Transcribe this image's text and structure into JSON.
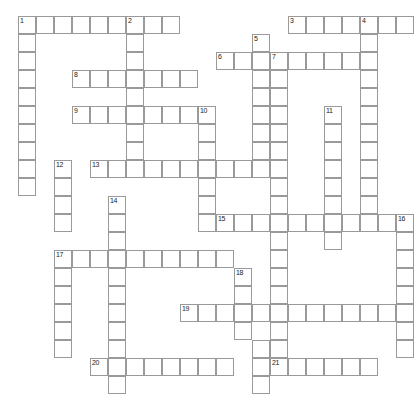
{
  "puzzle": {
    "title": "Crossword Grid",
    "type": "crossword",
    "cell_size": 18,
    "origin": {
      "x": 18,
      "y": 16
    },
    "grid_colors": {
      "cell_border": "#9a9a9a",
      "cell_fill": "#ffffff",
      "number": "#1a1a1a",
      "background": "#ffffff"
    },
    "entries": [
      {
        "number": 1,
        "direction": "across",
        "row": 0,
        "col": 0,
        "length": 9
      },
      {
        "number": 1,
        "direction": "down",
        "row": 0,
        "col": 0,
        "length": 10
      },
      {
        "number": 2,
        "direction": "down",
        "row": 0,
        "col": 6,
        "length": 9
      },
      {
        "number": 3,
        "direction": "across",
        "row": 0,
        "col": 15,
        "length": 7
      },
      {
        "number": 4,
        "direction": "down",
        "row": 0,
        "col": 19,
        "length": 12
      },
      {
        "number": 5,
        "direction": "down",
        "row": 1,
        "col": 13,
        "length": 6
      },
      {
        "number": 6,
        "direction": "across",
        "row": 2,
        "col": 11,
        "length": 9
      },
      {
        "number": 7,
        "direction": "down",
        "row": 2,
        "col": 14,
        "length": 17
      },
      {
        "number": 8,
        "direction": "across",
        "row": 3,
        "col": 3,
        "length": 7
      },
      {
        "number": 9,
        "direction": "across",
        "row": 5,
        "col": 3,
        "length": 8
      },
      {
        "number": 10,
        "direction": "down",
        "row": 5,
        "col": 10,
        "length": 7
      },
      {
        "number": 11,
        "direction": "down",
        "row": 5,
        "col": 17,
        "length": 8
      },
      {
        "number": 12,
        "direction": "down",
        "row": 8,
        "col": 2,
        "length": 4
      },
      {
        "number": 13,
        "direction": "across",
        "row": 8,
        "col": 4,
        "length": 11
      },
      {
        "number": 14,
        "direction": "down",
        "row": 10,
        "col": 5,
        "length": 10
      },
      {
        "number": 15,
        "direction": "across",
        "row": 11,
        "col": 11,
        "length": 10
      },
      {
        "number": 16,
        "direction": "down",
        "row": 11,
        "col": 21,
        "length": 7
      },
      {
        "number": 17,
        "direction": "across",
        "row": 13,
        "col": 2,
        "length": 10
      },
      {
        "number": 18,
        "direction": "down",
        "row": 14,
        "col": 12,
        "length": 5
      },
      {
        "number": 19,
        "direction": "across",
        "row": 16,
        "col": 9,
        "length": 13
      },
      {
        "number": 20,
        "direction": "across",
        "row": 19,
        "col": 4,
        "length": 8
      },
      {
        "number": 21,
        "direction": "across",
        "row": 19,
        "col": 14,
        "length": 6
      }
    ],
    "cells": [
      {
        "row": 0,
        "col": 0,
        "number": 1
      },
      {
        "row": 0,
        "col": 1
      },
      {
        "row": 0,
        "col": 2
      },
      {
        "row": 0,
        "col": 3
      },
      {
        "row": 0,
        "col": 4
      },
      {
        "row": 0,
        "col": 5
      },
      {
        "row": 0,
        "col": 6,
        "number": 2
      },
      {
        "row": 0,
        "col": 7
      },
      {
        "row": 0,
        "col": 8
      },
      {
        "row": 0,
        "col": 15,
        "number": 3
      },
      {
        "row": 0,
        "col": 16
      },
      {
        "row": 0,
        "col": 17
      },
      {
        "row": 0,
        "col": 18
      },
      {
        "row": 0,
        "col": 19,
        "number": 4
      },
      {
        "row": 0,
        "col": 20
      },
      {
        "row": 0,
        "col": 21
      },
      {
        "row": 1,
        "col": 0
      },
      {
        "row": 1,
        "col": 6
      },
      {
        "row": 1,
        "col": 13,
        "number": 5
      },
      {
        "row": 1,
        "col": 19
      },
      {
        "row": 2,
        "col": 0
      },
      {
        "row": 2,
        "col": 6
      },
      {
        "row": 2,
        "col": 11,
        "number": 6
      },
      {
        "row": 2,
        "col": 12
      },
      {
        "row": 2,
        "col": 13
      },
      {
        "row": 2,
        "col": 14,
        "number": 7
      },
      {
        "row": 2,
        "col": 15
      },
      {
        "row": 2,
        "col": 16
      },
      {
        "row": 2,
        "col": 17
      },
      {
        "row": 2,
        "col": 18
      },
      {
        "row": 2,
        "col": 19
      },
      {
        "row": 3,
        "col": 0
      },
      {
        "row": 3,
        "col": 3,
        "number": 8
      },
      {
        "row": 3,
        "col": 4
      },
      {
        "row": 3,
        "col": 5
      },
      {
        "row": 3,
        "col": 6
      },
      {
        "row": 3,
        "col": 7
      },
      {
        "row": 3,
        "col": 8
      },
      {
        "row": 3,
        "col": 9
      },
      {
        "row": 3,
        "col": 13
      },
      {
        "row": 3,
        "col": 14
      },
      {
        "row": 3,
        "col": 19
      },
      {
        "row": 4,
        "col": 0
      },
      {
        "row": 4,
        "col": 6
      },
      {
        "row": 4,
        "col": 13
      },
      {
        "row": 4,
        "col": 14
      },
      {
        "row": 4,
        "col": 19
      },
      {
        "row": 5,
        "col": 0
      },
      {
        "row": 5,
        "col": 3,
        "number": 9
      },
      {
        "row": 5,
        "col": 4
      },
      {
        "row": 5,
        "col": 5
      },
      {
        "row": 5,
        "col": 6
      },
      {
        "row": 5,
        "col": 7
      },
      {
        "row": 5,
        "col": 8
      },
      {
        "row": 5,
        "col": 9
      },
      {
        "row": 5,
        "col": 10,
        "number": 10
      },
      {
        "row": 5,
        "col": 13
      },
      {
        "row": 5,
        "col": 14
      },
      {
        "row": 5,
        "col": 17,
        "number": 11
      },
      {
        "row": 5,
        "col": 19
      },
      {
        "row": 6,
        "col": 0
      },
      {
        "row": 6,
        "col": 6
      },
      {
        "row": 6,
        "col": 10
      },
      {
        "row": 6,
        "col": 13
      },
      {
        "row": 6,
        "col": 14
      },
      {
        "row": 6,
        "col": 17
      },
      {
        "row": 6,
        "col": 19
      },
      {
        "row": 7,
        "col": 0
      },
      {
        "row": 7,
        "col": 6
      },
      {
        "row": 7,
        "col": 10
      },
      {
        "row": 7,
        "col": 13
      },
      {
        "row": 7,
        "col": 14
      },
      {
        "row": 7,
        "col": 17
      },
      {
        "row": 7,
        "col": 19
      },
      {
        "row": 8,
        "col": 0
      },
      {
        "row": 8,
        "col": 2,
        "number": 12
      },
      {
        "row": 8,
        "col": 4,
        "number": 13
      },
      {
        "row": 8,
        "col": 5
      },
      {
        "row": 8,
        "col": 6
      },
      {
        "row": 8,
        "col": 7
      },
      {
        "row": 8,
        "col": 8
      },
      {
        "row": 8,
        "col": 9
      },
      {
        "row": 8,
        "col": 10
      },
      {
        "row": 8,
        "col": 11
      },
      {
        "row": 8,
        "col": 12
      },
      {
        "row": 8,
        "col": 13
      },
      {
        "row": 8,
        "col": 14
      },
      {
        "row": 8,
        "col": 17
      },
      {
        "row": 8,
        "col": 19
      },
      {
        "row": 9,
        "col": 0
      },
      {
        "row": 9,
        "col": 2
      },
      {
        "row": 9,
        "col": 10
      },
      {
        "row": 9,
        "col": 14
      },
      {
        "row": 9,
        "col": 17
      },
      {
        "row": 9,
        "col": 19
      },
      {
        "row": 10,
        "col": 2
      },
      {
        "row": 10,
        "col": 5,
        "number": 14
      },
      {
        "row": 10,
        "col": 10
      },
      {
        "row": 10,
        "col": 14
      },
      {
        "row": 10,
        "col": 17
      },
      {
        "row": 10,
        "col": 19
      },
      {
        "row": 11,
        "col": 2
      },
      {
        "row": 11,
        "col": 5
      },
      {
        "row": 11,
        "col": 10
      },
      {
        "row": 11,
        "col": 11,
        "number": 15
      },
      {
        "row": 11,
        "col": 12
      },
      {
        "row": 11,
        "col": 13
      },
      {
        "row": 11,
        "col": 14
      },
      {
        "row": 11,
        "col": 15
      },
      {
        "row": 11,
        "col": 16
      },
      {
        "row": 11,
        "col": 17
      },
      {
        "row": 11,
        "col": 18
      },
      {
        "row": 11,
        "col": 19
      },
      {
        "row": 11,
        "col": 20
      },
      {
        "row": 11,
        "col": 21,
        "number": 16
      },
      {
        "row": 12,
        "col": 5
      },
      {
        "row": 12,
        "col": 14
      },
      {
        "row": 12,
        "col": 17
      },
      {
        "row": 12,
        "col": 21
      },
      {
        "row": 13,
        "col": 2,
        "number": 17
      },
      {
        "row": 13,
        "col": 3
      },
      {
        "row": 13,
        "col": 4
      },
      {
        "row": 13,
        "col": 5
      },
      {
        "row": 13,
        "col": 6
      },
      {
        "row": 13,
        "col": 7
      },
      {
        "row": 13,
        "col": 8
      },
      {
        "row": 13,
        "col": 9
      },
      {
        "row": 13,
        "col": 10
      },
      {
        "row": 13,
        "col": 11
      },
      {
        "row": 13,
        "col": 14
      },
      {
        "row": 13,
        "col": 21
      },
      {
        "row": 14,
        "col": 2
      },
      {
        "row": 14,
        "col": 5
      },
      {
        "row": 14,
        "col": 12,
        "number": 18
      },
      {
        "row": 14,
        "col": 14
      },
      {
        "row": 14,
        "col": 21
      },
      {
        "row": 15,
        "col": 2
      },
      {
        "row": 15,
        "col": 5
      },
      {
        "row": 15,
        "col": 12
      },
      {
        "row": 15,
        "col": 14
      },
      {
        "row": 15,
        "col": 21
      },
      {
        "row": 16,
        "col": 2
      },
      {
        "row": 16,
        "col": 5
      },
      {
        "row": 16,
        "col": 9,
        "number": 19
      },
      {
        "row": 16,
        "col": 10
      },
      {
        "row": 16,
        "col": 11
      },
      {
        "row": 16,
        "col": 12
      },
      {
        "row": 16,
        "col": 13
      },
      {
        "row": 16,
        "col": 14
      },
      {
        "row": 16,
        "col": 15
      },
      {
        "row": 16,
        "col": 16
      },
      {
        "row": 16,
        "col": 17
      },
      {
        "row": 16,
        "col": 18
      },
      {
        "row": 16,
        "col": 19
      },
      {
        "row": 16,
        "col": 20
      },
      {
        "row": 16,
        "col": 21
      },
      {
        "row": 17,
        "col": 2
      },
      {
        "row": 17,
        "col": 5
      },
      {
        "row": 17,
        "col": 12
      },
      {
        "row": 17,
        "col": 14
      },
      {
        "row": 17,
        "col": 21
      },
      {
        "row": 18,
        "col": 2
      },
      {
        "row": 18,
        "col": 5
      },
      {
        "row": 18,
        "col": 13
      },
      {
        "row": 18,
        "col": 14
      },
      {
        "row": 18,
        "col": 21
      },
      {
        "row": 19,
        "col": 4,
        "number": 20
      },
      {
        "row": 19,
        "col": 5
      },
      {
        "row": 19,
        "col": 6
      },
      {
        "row": 19,
        "col": 7
      },
      {
        "row": 19,
        "col": 8
      },
      {
        "row": 19,
        "col": 9
      },
      {
        "row": 19,
        "col": 10
      },
      {
        "row": 19,
        "col": 11
      },
      {
        "row": 19,
        "col": 13
      },
      {
        "row": 19,
        "col": 14,
        "number": 21
      },
      {
        "row": 19,
        "col": 15
      },
      {
        "row": 19,
        "col": 16
      },
      {
        "row": 19,
        "col": 17
      },
      {
        "row": 19,
        "col": 18
      },
      {
        "row": 19,
        "col": 19
      },
      {
        "row": 20,
        "col": 5
      },
      {
        "row": 20,
        "col": 13
      }
    ]
  }
}
